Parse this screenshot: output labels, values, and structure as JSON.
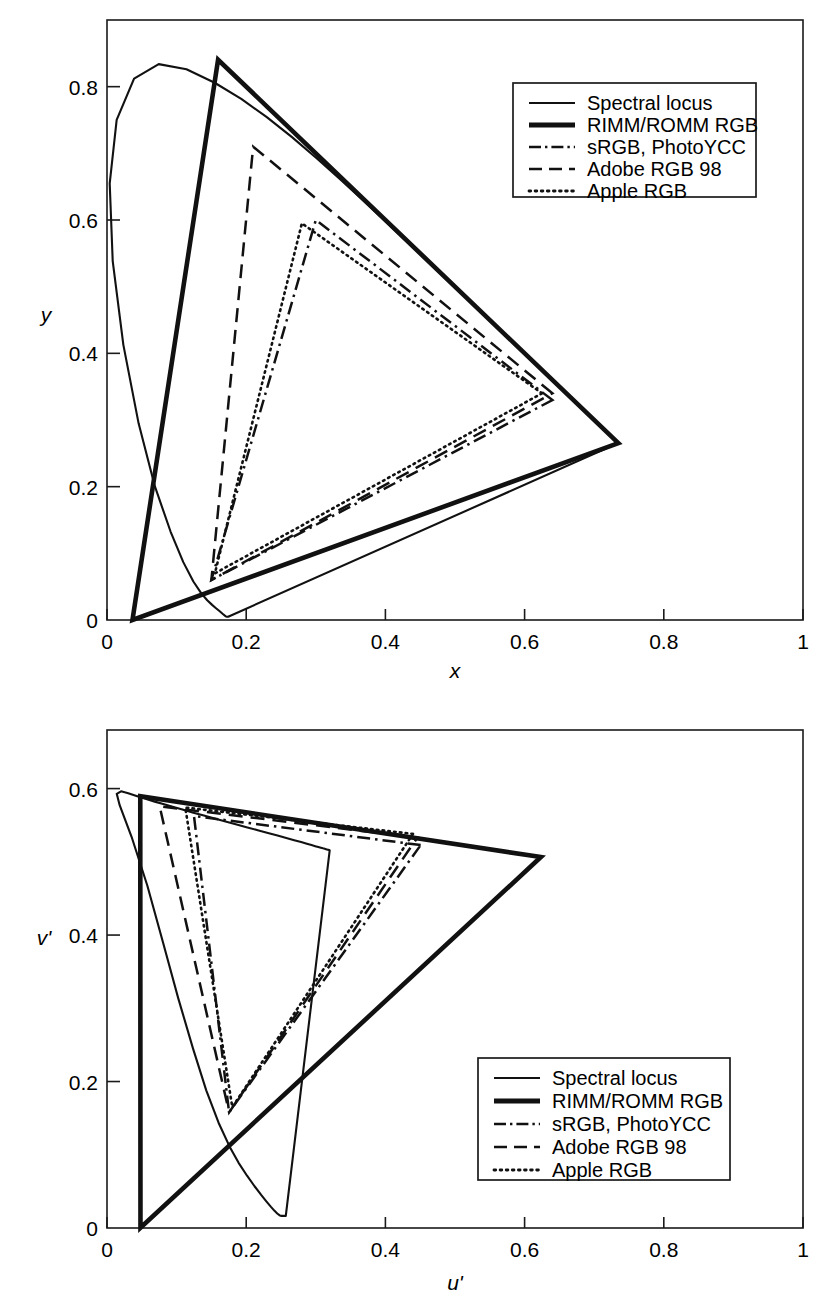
{
  "chart_data": [
    {
      "id": "cie-xy",
      "type": "line",
      "title": "",
      "xlabel": "x",
      "ylabel": "y",
      "xlim": [
        0,
        1
      ],
      "ylim": [
        0,
        0.9
      ],
      "grid": false,
      "xticks": [
        "0",
        "0.2",
        "0.4",
        "0.6",
        "0.8",
        "1"
      ],
      "xtick_values": [
        0,
        0.2,
        0.4,
        0.6,
        0.8,
        1
      ],
      "yticks": [
        "0",
        "0.2",
        "0.4",
        "0.6",
        "0.8"
      ],
      "ytick_values": [
        0,
        0.2,
        0.4,
        0.6,
        0.8
      ],
      "legend_position": "upper right",
      "series": [
        {
          "name": "Spectral locus",
          "style": "solid-thin",
          "closed": true,
          "points": [
            [
              0.1741,
              0.005
            ],
            [
              0.174,
              0.005
            ],
            [
              0.1738,
              0.0049
            ],
            [
              0.1736,
              0.0049
            ],
            [
              0.1733,
              0.0048
            ],
            [
              0.173,
              0.0048
            ],
            [
              0.1726,
              0.0048
            ],
            [
              0.1721,
              0.0048
            ],
            [
              0.1714,
              0.0051
            ],
            [
              0.1703,
              0.0058
            ],
            [
              0.1689,
              0.0069
            ],
            [
              0.1669,
              0.0086
            ],
            [
              0.1644,
              0.0109
            ],
            [
              0.1611,
              0.0138
            ],
            [
              0.1566,
              0.0177
            ],
            [
              0.151,
              0.0227
            ],
            [
              0.144,
              0.0297
            ],
            [
              0.1355,
              0.0399
            ],
            [
              0.1241,
              0.0578
            ],
            [
              0.1096,
              0.0868
            ],
            [
              0.0913,
              0.1327
            ],
            [
              0.0687,
              0.2007
            ],
            [
              0.0454,
              0.295
            ],
            [
              0.0235,
              0.4127
            ],
            [
              0.0082,
              0.5384
            ],
            [
              0.0039,
              0.6548
            ],
            [
              0.0139,
              0.7502
            ],
            [
              0.0389,
              0.812
            ],
            [
              0.0743,
              0.8338
            ],
            [
              0.1142,
              0.8262
            ],
            [
              0.1547,
              0.8059
            ],
            [
              0.1929,
              0.7816
            ],
            [
              0.2296,
              0.7543
            ],
            [
              0.2658,
              0.7243
            ],
            [
              0.3016,
              0.6923
            ],
            [
              0.3373,
              0.6589
            ],
            [
              0.3731,
              0.6245
            ],
            [
              0.4087,
              0.5896
            ],
            [
              0.4441,
              0.5547
            ],
            [
              0.4788,
              0.5202
            ],
            [
              0.5125,
              0.4866
            ],
            [
              0.5448,
              0.4544
            ],
            [
              0.5752,
              0.4242
            ],
            [
              0.6029,
              0.3965
            ],
            [
              0.627,
              0.3725
            ],
            [
              0.6482,
              0.3514
            ],
            [
              0.6658,
              0.334
            ],
            [
              0.6801,
              0.3197
            ],
            [
              0.6915,
              0.3083
            ],
            [
              0.7006,
              0.2993
            ],
            [
              0.7079,
              0.292
            ],
            [
              0.714,
              0.2859
            ],
            [
              0.719,
              0.2809
            ],
            [
              0.723,
              0.277
            ],
            [
              0.726,
              0.274
            ],
            [
              0.7283,
              0.2717
            ],
            [
              0.73,
              0.27
            ],
            [
              0.7311,
              0.2689
            ],
            [
              0.732,
              0.268
            ],
            [
              0.7327,
              0.2673
            ],
            [
              0.7334,
              0.2666
            ],
            [
              0.734,
              0.266
            ],
            [
              0.7344,
              0.2656
            ],
            [
              0.7346,
              0.2654
            ]
          ]
        },
        {
          "name": "RIMM/ROMM RGB",
          "style": "solid-thick",
          "closed": true,
          "points": [
            [
              0.7347,
              0.2653
            ],
            [
              0.1596,
              0.8404
            ],
            [
              0.0366,
              0.0001
            ]
          ]
        },
        {
          "name": "sRGB, PhotoYCC",
          "style": "dash-dot",
          "closed": true,
          "points": [
            [
              0.64,
              0.33
            ],
            [
              0.3,
              0.6
            ],
            [
              0.15,
              0.06
            ]
          ]
        },
        {
          "name": "Adobe RGB 98",
          "style": "dashed",
          "closed": true,
          "points": [
            [
              0.64,
              0.34
            ],
            [
              0.21,
              0.71
            ],
            [
              0.15,
              0.06
            ]
          ]
        },
        {
          "name": "Apple RGB",
          "style": "dotted",
          "closed": true,
          "points": [
            [
              0.625,
              0.34
            ],
            [
              0.28,
              0.595
            ],
            [
              0.155,
              0.07
            ]
          ]
        }
      ]
    },
    {
      "id": "cie-uv",
      "type": "line",
      "title": "",
      "xlabel": "u'",
      "ylabel": "v'",
      "xlim": [
        0,
        1
      ],
      "ylim": [
        0,
        0.68
      ],
      "grid": false,
      "xticks": [
        "0",
        "0.2",
        "0.4",
        "0.6",
        "0.8",
        "1"
      ],
      "xtick_values": [
        0,
        0.2,
        0.4,
        0.6,
        0.8,
        1
      ],
      "yticks": [
        "0",
        "0.2",
        "0.4",
        "0.6"
      ],
      "ytick_values": [
        0,
        0.2,
        0.4,
        0.6
      ],
      "legend_position": "lower right",
      "series": [
        {
          "name": "Spectral locus",
          "style": "solid-thin",
          "closed": true,
          "points": [
            [
              0.2569,
              0.0166
            ],
            [
              0.2564,
              0.0166
            ],
            [
              0.2558,
              0.0166
            ],
            [
              0.255,
              0.0166
            ],
            [
              0.2541,
              0.0165
            ],
            [
              0.253,
              0.0165
            ],
            [
              0.2516,
              0.0165
            ],
            [
              0.2499,
              0.0166
            ],
            [
              0.2477,
              0.0175
            ],
            [
              0.2446,
              0.0198
            ],
            [
              0.2407,
              0.0234
            ],
            [
              0.2356,
              0.0288
            ],
            [
              0.2292,
              0.0361
            ],
            [
              0.2215,
              0.0452
            ],
            [
              0.212,
              0.057
            ],
            [
              0.2012,
              0.0714
            ],
            [
              0.1891,
              0.089
            ],
            [
              0.1762,
              0.1111
            ],
            [
              0.1603,
              0.1438
            ],
            [
              0.1426,
              0.188
            ],
            [
              0.1235,
              0.2453
            ],
            [
              0.1023,
              0.3139
            ],
            [
              0.0803,
              0.3905
            ],
            [
              0.0579,
              0.4676
            ],
            [
              0.0353,
              0.5342
            ],
            [
              0.0182,
              0.5774
            ],
            [
              0.014,
              0.5929
            ],
            [
              0.0202,
              0.5963
            ],
            [
              0.0305,
              0.5936
            ],
            [
              0.0424,
              0.5899
            ],
            [
              0.0553,
              0.586
            ],
            [
              0.0686,
              0.5822
            ],
            [
              0.082,
              0.5785
            ],
            [
              0.0955,
              0.5748
            ],
            [
              0.1096,
              0.571
            ],
            [
              0.1241,
              0.5671
            ],
            [
              0.1392,
              0.5631
            ],
            [
              0.1546,
              0.5591
            ],
            [
              0.1703,
              0.555
            ],
            [
              0.1862,
              0.551
            ],
            [
              0.2017,
              0.547
            ],
            [
              0.2166,
              0.5432
            ],
            [
              0.2312,
              0.5395
            ],
            [
              0.245,
              0.5359
            ],
            [
              0.2576,
              0.5326
            ],
            [
              0.269,
              0.5296
            ],
            [
              0.2789,
              0.527
            ],
            [
              0.2871,
              0.5247
            ],
            [
              0.2938,
              0.5229
            ],
            [
              0.2992,
              0.5214
            ],
            [
              0.3036,
              0.5202
            ],
            [
              0.3073,
              0.5192
            ],
            [
              0.3103,
              0.5184
            ],
            [
              0.3128,
              0.5178
            ],
            [
              0.3146,
              0.5173
            ],
            [
              0.316,
              0.5169
            ],
            [
              0.3171,
              0.5166
            ],
            [
              0.3178,
              0.5164
            ],
            [
              0.3184,
              0.5163
            ],
            [
              0.3188,
              0.5162
            ],
            [
              0.3192,
              0.5161
            ],
            [
              0.3196,
              0.516
            ],
            [
              0.3199,
              0.5159
            ],
            [
              0.32,
              0.5159
            ]
          ]
        },
        {
          "name": "RIMM/ROMM RGB",
          "style": "solid-thick",
          "closed": true,
          "points": [
            [
              0.6234,
              0.5065
            ],
            [
              0.0478,
              0.5896
            ],
            [
              0.0481,
              0.0003
            ]
          ]
        },
        {
          "name": "sRGB, PhotoYCC",
          "style": "dash-dot",
          "closed": true,
          "points": [
            [
              0.4507,
              0.5229
            ],
            [
              0.125,
              0.5625
            ],
            [
              0.1754,
              0.1579
            ]
          ]
        },
        {
          "name": "Adobe RGB 98",
          "style": "dashed",
          "closed": true,
          "points": [
            [
              0.4459,
              0.533
            ],
            [
              0.0757,
              0.5757
            ],
            [
              0.1754,
              0.1579
            ]
          ]
        },
        {
          "name": "Apple RGB",
          "style": "dotted",
          "closed": true,
          "points": [
            [
              0.4396,
              0.5381
            ],
            [
              0.1125,
              0.5741
            ],
            [
              0.18,
              0.165
            ]
          ]
        }
      ]
    }
  ],
  "legend": {
    "entries": [
      {
        "label": "Spectral locus",
        "style": "solid-thin"
      },
      {
        "label": "RIMM/ROMM RGB",
        "style": "solid-thick"
      },
      {
        "label": "sRGB, PhotoYCC",
        "style": "dash-dot"
      },
      {
        "label": "Adobe RGB 98",
        "style": "dashed"
      },
      {
        "label": "Apple RGB",
        "style": "dotted"
      }
    ]
  },
  "colors": {
    "ink": "#111111",
    "frame": "#1a1a1a",
    "background": "#ffffff"
  }
}
